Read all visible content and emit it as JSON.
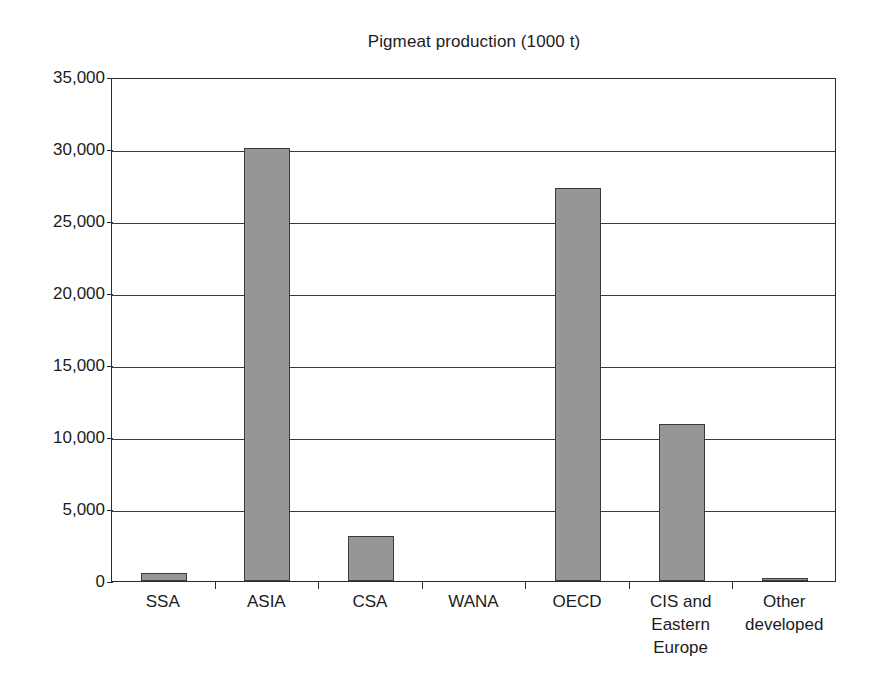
{
  "chart_data": {
    "type": "bar",
    "title": "Pigmeat production (1000 t)",
    "subtitle": "",
    "xlabel": "",
    "ylabel": "",
    "categories": [
      "SSA",
      "ASIA",
      "CSA",
      "WANA",
      "OECD",
      "CIS and Eastern Europe",
      "Other developed"
    ],
    "category_lines": [
      [
        "SSA"
      ],
      [
        "ASIA"
      ],
      [
        "CSA"
      ],
      [
        "WANA"
      ],
      [
        "OECD"
      ],
      [
        "CIS and",
        "Eastern",
        "Europe"
      ],
      [
        "Other",
        "developed"
      ]
    ],
    "values": [
      550,
      30100,
      3100,
      0,
      27300,
      10900,
      200
    ],
    "ylim": [
      0,
      35000
    ],
    "ytick_values": [
      0,
      5000,
      10000,
      15000,
      20000,
      25000,
      30000,
      35000
    ],
    "ytick_labels": [
      "0",
      "5,000",
      "10,000",
      "15,000",
      "20,000",
      "25,000",
      "30,000",
      "35,000"
    ],
    "grid": "horizontal",
    "legend": "none",
    "series_color": "#969696",
    "bar_edge_color": "#3b3b3b",
    "axis_color": "#2b2b2b",
    "gridline_color": "#3a3a3a",
    "background_color": "#ffffff"
  }
}
